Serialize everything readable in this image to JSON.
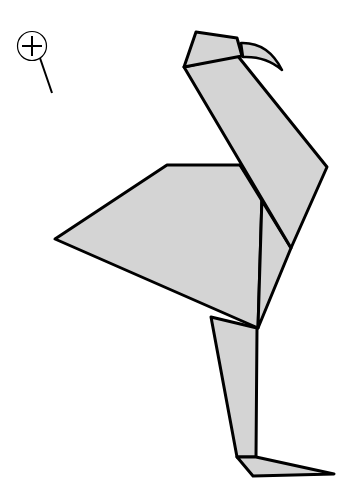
{
  "illustration": {
    "subject": "origami flamingo",
    "fill_color": "#d4d4d4",
    "stroke_color": "#000000",
    "background": "#ffffff"
  },
  "controls": {
    "zoom_icon": "magnifier-plus-icon"
  }
}
